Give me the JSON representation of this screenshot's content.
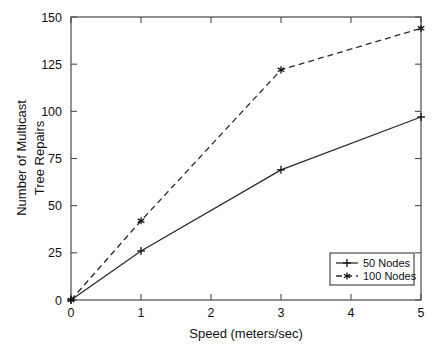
{
  "chart_data": {
    "type": "line",
    "title": "",
    "xlabel": "Speed (meters/sec)",
    "ylabel": "Number of Multicast Tree Repairs",
    "ylabel_line1": "Number of Multicast",
    "ylabel_line2": "Tree Repairs",
    "x": [
      0,
      1,
      3,
      5
    ],
    "xlim": [
      0,
      5
    ],
    "ylim": [
      0,
      150
    ],
    "xticks": [
      "0",
      "1",
      "2",
      "3",
      "4",
      "5"
    ],
    "yticks": [
      "0",
      "25",
      "50",
      "75",
      "100",
      "125",
      "150"
    ],
    "grid": false,
    "legend_position": "lower right",
    "series": [
      {
        "name": "50 Nodes",
        "values": [
          0,
          26,
          69,
          97
        ],
        "linestyle": "solid",
        "marker": "plus",
        "color": "#2a2a2a"
      },
      {
        "name": "100 Nodes",
        "values": [
          0,
          42,
          122,
          144
        ],
        "linestyle": "dashed",
        "marker": "star",
        "color": "#2a2a2a"
      }
    ]
  },
  "legend": {
    "entries": [
      {
        "label": "50 Nodes"
      },
      {
        "label": "100 Nodes"
      }
    ]
  },
  "axes": {
    "x_title": "Speed (meters/sec)",
    "y_title_line1": "Number of Multicast",
    "y_title_line2": "Tree Repairs"
  }
}
